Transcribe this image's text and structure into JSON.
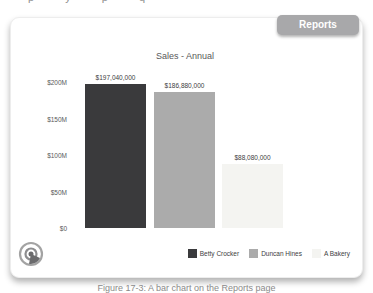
{
  "page": {
    "top_text_fragment": "p y p q",
    "caption": "Figure 17-3: A bar chart on the Reports page"
  },
  "reports_button": {
    "label": "Reports"
  },
  "chart_data": {
    "type": "bar",
    "title": "Sales - Annual",
    "categories": [
      "Betty Crocker",
      "Duncan Hines",
      "A Bakery"
    ],
    "values": [
      197040000,
      186880000,
      88080000
    ],
    "value_labels": [
      "$197,040,000",
      "$186,880,000",
      "$88,080,000"
    ],
    "colors": [
      "#3a3a3c",
      "#ababab",
      "#f4f4f1"
    ],
    "yticks": [
      {
        "label": "$0",
        "value": 0
      },
      {
        "label": "$50M",
        "value": 50000000
      },
      {
        "label": "$100M",
        "value": 100000000
      },
      {
        "label": "$150M",
        "value": 150000000
      },
      {
        "label": "$200M",
        "value": 200000000
      }
    ],
    "ylim": [
      0,
      200000000
    ],
    "grid": false,
    "legend_position": "bottom-right",
    "logo_color_outer": "#a3a3a3",
    "logo_color_inner": "#6b6b6d"
  }
}
